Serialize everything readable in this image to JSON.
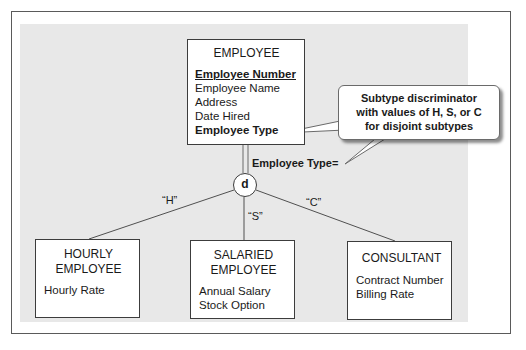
{
  "diagram": {
    "supertype": {
      "name": "EMPLOYEE",
      "attributes": [
        {
          "text": "Employee Number",
          "style": "identifier"
        },
        {
          "text": "Employee Name",
          "style": "normal"
        },
        {
          "text": "Address",
          "style": "normal"
        },
        {
          "text": "Date Hired",
          "style": "normal"
        },
        {
          "text": "Employee Type",
          "style": "bold"
        }
      ]
    },
    "discriminator": {
      "label": "Employee Type=",
      "symbol": "d"
    },
    "callout": {
      "lines": [
        "Subtype discriminator",
        "with values of H, S, or C",
        "for disjoint subtypes"
      ]
    },
    "branch_values": [
      "“H”",
      "“S”",
      "“C”"
    ],
    "subtypes": [
      {
        "name_lines": [
          "HOURLY",
          "EMPLOYEE"
        ],
        "attributes": [
          "Hourly Rate"
        ]
      },
      {
        "name_lines": [
          "SALARIED",
          "EMPLOYEE"
        ],
        "attributes": [
          "Annual Salary",
          "Stock Option"
        ]
      },
      {
        "name_lines": [
          "CONSULTANT"
        ],
        "attributes": [
          "Contract Number",
          "Billing Rate"
        ]
      }
    ]
  }
}
